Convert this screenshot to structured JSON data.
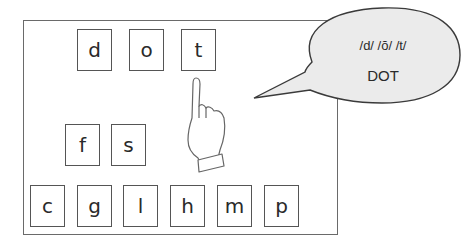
{
  "word_tiles": [
    {
      "letter": "d",
      "x": 77,
      "y": 29
    },
    {
      "letter": "o",
      "x": 129,
      "y": 29
    },
    {
      "letter": "t",
      "x": 181,
      "y": 29
    }
  ],
  "extra_tiles": [
    {
      "letter": "f",
      "x": 65,
      "y": 124
    },
    {
      "letter": "s",
      "x": 111,
      "y": 124
    }
  ],
  "bottom_tiles": [
    {
      "letter": "c",
      "x": 30,
      "y": 185
    },
    {
      "letter": "g",
      "x": 77,
      "y": 185
    },
    {
      "letter": "l",
      "x": 123,
      "y": 185
    },
    {
      "letter": "h",
      "x": 170,
      "y": 185
    },
    {
      "letter": "m",
      "x": 217,
      "y": 185
    },
    {
      "letter": "p",
      "x": 264,
      "y": 185
    }
  ],
  "speech_bubble": {
    "phonemes": "/d/ /ŏ/ /t/",
    "word": "DOT",
    "fill": "#ebebeb",
    "stroke": "#3a3a3a"
  },
  "pointer": {
    "icon": "pointing-hand-icon",
    "target_letter": "t"
  }
}
